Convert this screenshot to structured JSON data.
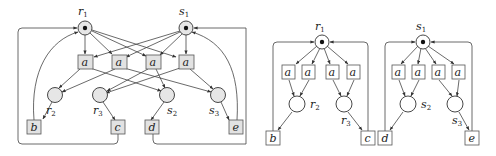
{
  "left_net": {
    "places": {
      "r1": {
        "label": "r",
        "sub": "1",
        "token": true
      },
      "s1": {
        "label": "s",
        "sub": "1",
        "token": true
      },
      "r2": {
        "label": "r",
        "sub": "2"
      },
      "r3": {
        "label": "r",
        "sub": "3"
      },
      "s2": {
        "label": "s",
        "sub": "2"
      },
      "s3": {
        "label": "s",
        "sub": "3"
      }
    },
    "transitions": {
      "a1": "a",
      "a2": "a",
      "a3": "a",
      "a4": "a",
      "b": "b",
      "c": "c",
      "d": "d",
      "e": "e"
    }
  },
  "right_net_r": {
    "places": {
      "r1": {
        "label": "r",
        "sub": "1",
        "token": true
      },
      "r2": {
        "label": "r",
        "sub": "2"
      },
      "r3": {
        "label": "r",
        "sub": "3"
      }
    },
    "transitions": {
      "a1": "a",
      "a2": "a",
      "a3": "a",
      "a4": "a",
      "b": "b",
      "c": "c"
    }
  },
  "right_net_s": {
    "places": {
      "s1": {
        "label": "s",
        "sub": "1",
        "token": true
      },
      "s2": {
        "label": "s",
        "sub": "2"
      },
      "s3": {
        "label": "s",
        "sub": "3"
      }
    },
    "transitions": {
      "a1": "a",
      "a2": "a",
      "a3": "a",
      "a4": "a",
      "d": "d",
      "e": "e"
    }
  }
}
